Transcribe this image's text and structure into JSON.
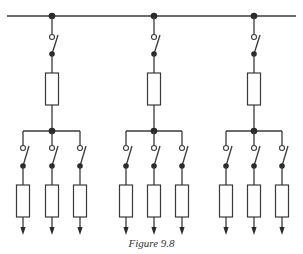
{
  "figure": {
    "caption": "Figure 9.8"
  },
  "colors": {
    "line": "#3a3a3a",
    "background": "#ffffff"
  },
  "main_bus": {
    "label": "main-busbar",
    "y": 16,
    "x_start": 7,
    "x_end": 296
  },
  "feeders": [
    {
      "id": "feeder-left",
      "x": 52,
      "switch": "open-switch",
      "component": "rectangle-impedance",
      "sub_bus_x": [
        23,
        80
      ],
      "branches": [
        {
          "x": 23,
          "switch": "open-switch",
          "component": "rectangle-impedance",
          "terminal": "arrow-down"
        },
        {
          "x": 52,
          "switch": "open-switch",
          "component": "rectangle-impedance",
          "terminal": "arrow-down"
        },
        {
          "x": 80,
          "switch": "open-switch",
          "component": "rectangle-impedance",
          "terminal": "arrow-down"
        }
      ]
    },
    {
      "id": "feeder-center",
      "x": 154,
      "switch": "open-switch",
      "component": "rectangle-impedance",
      "sub_bus_x": [
        126,
        182
      ],
      "branches": [
        {
          "x": 126,
          "switch": "open-switch",
          "component": "rectangle-impedance",
          "terminal": "arrow-down"
        },
        {
          "x": 154,
          "switch": "open-switch",
          "component": "rectangle-impedance",
          "terminal": "arrow-down"
        },
        {
          "x": 182,
          "switch": "open-switch",
          "component": "rectangle-impedance",
          "terminal": "arrow-down"
        }
      ]
    },
    {
      "id": "feeder-right",
      "x": 254,
      "switch": "open-switch",
      "component": "rectangle-impedance",
      "sub_bus_x": [
        226,
        282
      ],
      "branches": [
        {
          "x": 226,
          "switch": "open-switch",
          "component": "rectangle-impedance",
          "terminal": "arrow-down"
        },
        {
          "x": 254,
          "switch": "open-switch",
          "component": "rectangle-impedance",
          "terminal": "arrow-down"
        },
        {
          "x": 282,
          "switch": "open-switch",
          "component": "rectangle-impedance",
          "terminal": "arrow-down"
        }
      ]
    }
  ]
}
